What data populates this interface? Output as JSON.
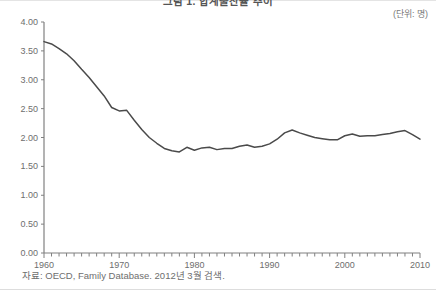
{
  "figure": {
    "title": "그림 1. 합계출산율 추이",
    "unit_label": "(단위: 명)",
    "source_label": "자료: OECD, Family Database. 2012년 3월 검색.",
    "line_color": "#4a4a4a",
    "axis_color": "#808080",
    "text_color": "#6e6e6e",
    "background_color": "#ffffff"
  },
  "chart_data": {
    "type": "line",
    "title": "그림 1. 합계출산율 추이",
    "xlabel": "",
    "ylabel": "",
    "unit": "명",
    "grid": false,
    "legend": false,
    "xlim": [
      1960,
      2010
    ],
    "ylim": [
      0.0,
      4.0
    ],
    "ytick_labels": [
      "0.00",
      "0.50",
      "1.00",
      "1.50",
      "2.00",
      "2.50",
      "3.00",
      "3.50",
      "4.00"
    ],
    "ytick_values": [
      0.0,
      0.5,
      1.0,
      1.5,
      2.0,
      2.5,
      3.0,
      3.5,
      4.0
    ],
    "xtick_labels": [
      "1960",
      "1970",
      "1980",
      "1990",
      "2000",
      "2010"
    ],
    "xtick_values": [
      1960,
      1970,
      1980,
      1990,
      2000,
      2010
    ],
    "minor_xtick_interval": 1,
    "series": [
      {
        "name": "합계출산율",
        "color": "#4a4a4a",
        "x": [
          1960,
          1961,
          1962,
          1963,
          1964,
          1965,
          1966,
          1967,
          1968,
          1969,
          1970,
          1971,
          1972,
          1973,
          1974,
          1975,
          1976,
          1977,
          1978,
          1979,
          1980,
          1981,
          1982,
          1983,
          1984,
          1985,
          1986,
          1987,
          1988,
          1989,
          1990,
          1991,
          1992,
          1993,
          1994,
          1995,
          1996,
          1997,
          1998,
          1999,
          2000,
          2001,
          2002,
          2003,
          2004,
          2005,
          2006,
          2007,
          2008,
          2009,
          2010
        ],
        "values": [
          3.66,
          3.62,
          3.54,
          3.45,
          3.33,
          3.18,
          3.04,
          2.88,
          2.72,
          2.52,
          2.46,
          2.47,
          2.3,
          2.14,
          2.0,
          1.9,
          1.81,
          1.77,
          1.75,
          1.83,
          1.78,
          1.82,
          1.83,
          1.79,
          1.81,
          1.81,
          1.85,
          1.87,
          1.83,
          1.85,
          1.89,
          1.97,
          2.08,
          2.13,
          2.08,
          2.04,
          2.0,
          1.98,
          1.96,
          1.96,
          2.03,
          2.06,
          2.02,
          2.03,
          2.03,
          2.05,
          2.07,
          2.1,
          2.12,
          2.05,
          1.97
        ]
      }
    ]
  }
}
